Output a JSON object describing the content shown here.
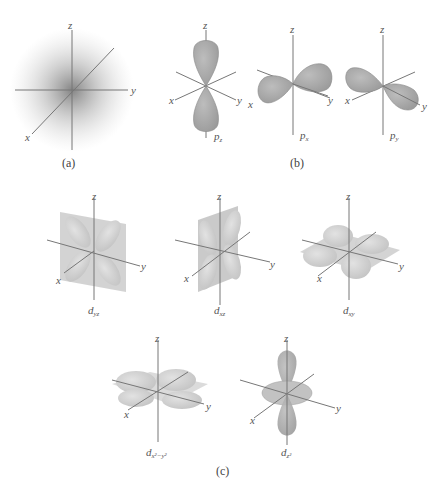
{
  "figure": {
    "panels": [
      {
        "id": "a",
        "caption": "(a)",
        "orbital": "s",
        "axes": {
          "x": "x",
          "y": "y",
          "z": "z"
        }
      },
      {
        "id": "b",
        "caption": "(b)",
        "orbitals": [
          {
            "name": "p",
            "subscript": "z"
          },
          {
            "name": "p",
            "subscript": "x"
          },
          {
            "name": "p",
            "subscript": "y"
          }
        ]
      },
      {
        "id": "c",
        "caption": "(c)",
        "orbitals": [
          {
            "name": "d",
            "subscript": "yz"
          },
          {
            "name": "d",
            "subscript": "xz"
          },
          {
            "name": "d",
            "subscript": "xy"
          },
          {
            "name": "d",
            "subscript": "x²−y²"
          },
          {
            "name": "d",
            "subscript": "z²"
          }
        ]
      }
    ],
    "axis_labels": {
      "x": "x",
      "y": "y",
      "z": "z"
    },
    "colors": {
      "lobe": "#a9a9a9",
      "lobe_light": "#c8c8c8",
      "plane": "#bdbdbd",
      "axis": "#777777",
      "cloud": "#8a8a8a"
    }
  }
}
